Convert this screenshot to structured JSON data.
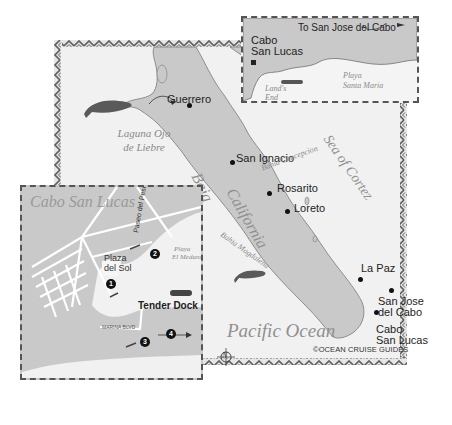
{
  "map": {
    "type": "regional travel map",
    "colors": {
      "land": "#c9c9c9",
      "water": "#f1f1f1",
      "border_pattern": "#6a6a6a",
      "text": "#1e1e1e",
      "italic_label": "#8a8a8a"
    },
    "main": {
      "cities": [
        {
          "name": "Guerrero"
        },
        {
          "name": "San Ignacio"
        },
        {
          "name": "Rosarito"
        },
        {
          "name": "Loreto"
        },
        {
          "name": "La Paz"
        },
        {
          "name": "San Jose",
          "line2": "del Cabo"
        },
        {
          "name": "Cabo",
          "line2": "San Lucas"
        }
      ],
      "region_labels": {
        "baja": "Baja",
        "california": "California",
        "pacific_ocean": "Pacific Ocean",
        "sea_of_cortez": "Sea of Cortez",
        "laguna_line1": "Laguna Ojo",
        "laguna_line2": "de Liebre",
        "bahia_concepcion": "Bahia Concepcion",
        "bahia_magdalena": "Bahia Magdalena"
      },
      "compass_letter": "N",
      "copyright": "©OCEAN CRUISE GUIDES"
    },
    "inset_top": {
      "city_line1": "Cabo",
      "city_line2": "San Lucas",
      "to_label": "To San Jose del Cabo",
      "beach_line1": "Playa",
      "beach_line2": "Santa Maria",
      "lands_end_line1": "Land's",
      "lands_end_line2": "End"
    },
    "inset_town": {
      "title": "Cabo San Lucas",
      "street_paseo": "Paseo del Pescador",
      "street_marina": "MARINA BLVD",
      "street_highway": "Carretera San Jose del Cabo",
      "street_cardenas": "Av. Cardenas",
      "street_morelos": "Morelos",
      "street_lazaro": "Av. Lazaro Cardenas",
      "plaza_line1": "Plaza",
      "plaza_line2": "del Sol",
      "beach_line1": "Playa",
      "beach_line2": "El Medano",
      "tender_dock": "Tender Dock",
      "markers": [
        "1",
        "2",
        "3",
        "4"
      ]
    }
  }
}
